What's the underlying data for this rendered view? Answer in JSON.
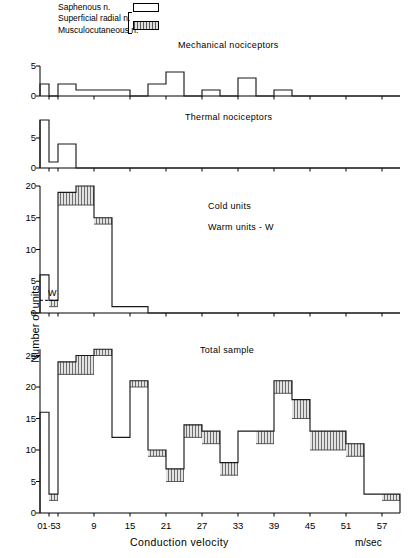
{
  "legend": {
    "items": [
      {
        "label": "Saphenous n.",
        "swatch": "open-box"
      },
      {
        "label": "Superficial  radial n.",
        "swatch": "hatched-box"
      },
      {
        "label": "Musculocutaneous n.",
        "swatch": "hatched-box"
      }
    ]
  },
  "axes": {
    "y_title": "Number of units",
    "x_title": "Conduction  velocity",
    "x_units": "m/sec",
    "x_ticklabels": [
      "0",
      "1·5",
      "3",
      "9",
      "15",
      "21",
      "27",
      "33",
      "39",
      "45",
      "51",
      "57"
    ],
    "x_tickvalues": [
      0,
      1.5,
      3,
      9,
      15,
      21,
      27,
      33,
      39,
      45,
      51,
      57
    ],
    "x_range": [
      0,
      60
    ]
  },
  "annotations": {
    "warm_marker": "W"
  },
  "chart_data": [
    {
      "type": "bar",
      "title": "Mechanical  nociceptors",
      "xlabel": "Conduction  velocity",
      "ylabel": "Number of units",
      "ylim": [
        0,
        5
      ],
      "yticks": [
        0,
        5
      ],
      "yticklabels": [
        "0",
        "5"
      ],
      "grid": false,
      "bin_edges": [
        0,
        1.5,
        3,
        6,
        9,
        12,
        15,
        18,
        21,
        24,
        27,
        30,
        33,
        36,
        39,
        42,
        45,
        48,
        51,
        54,
        57,
        60
      ],
      "series": [
        {
          "name": "Saphenous n.",
          "values": [
            2,
            0,
            2,
            1,
            1,
            1,
            0,
            2,
            4,
            0,
            1,
            0,
            3,
            0,
            1,
            0,
            0,
            0,
            0,
            0,
            0
          ]
        },
        {
          "name": "Superficial radial / Musculocutaneous n.",
          "values": [
            0,
            0,
            0,
            0,
            0,
            0,
            0,
            0,
            0,
            0,
            0,
            0,
            0,
            0,
            0,
            0,
            0,
            0,
            0,
            0,
            0
          ]
        }
      ]
    },
    {
      "type": "bar",
      "title": "Thermal  nociceptors",
      "xlabel": "Conduction  velocity",
      "ylabel": "Number of units",
      "ylim": [
        0,
        8
      ],
      "yticks": [
        0,
        5
      ],
      "yticklabels": [
        "0",
        "5"
      ],
      "grid": false,
      "bin_edges": [
        0,
        1.5,
        3,
        6,
        9,
        12,
        15,
        18,
        21,
        24,
        27,
        30,
        33,
        36,
        39,
        42,
        45,
        48,
        51,
        54,
        57,
        60
      ],
      "series": [
        {
          "name": "Saphenous n.",
          "values": [
            8,
            1,
            4,
            0,
            0,
            0,
            0,
            0,
            0,
            0,
            0,
            0,
            0,
            0,
            0,
            0,
            0,
            0,
            0,
            0,
            0
          ]
        },
        {
          "name": "Superficial radial / Musculocutaneous n.",
          "values": [
            0,
            0,
            0,
            0,
            0,
            0,
            0,
            0,
            0,
            0,
            0,
            0,
            0,
            0,
            0,
            0,
            0,
            0,
            0,
            0,
            0
          ]
        }
      ]
    },
    {
      "type": "bar",
      "title": "Cold units",
      "subtitle": "Warm units - W",
      "xlabel": "Conduction  velocity",
      "ylabel": "Number of units",
      "ylim": [
        0,
        20
      ],
      "yticks": [
        0,
        5,
        10,
        15,
        20
      ],
      "yticklabels": [
        "0",
        "5",
        "10",
        "15",
        "20"
      ],
      "grid": false,
      "bin_edges": [
        0,
        1.5,
        3,
        6,
        9,
        12,
        15,
        18,
        21,
        24,
        27,
        30,
        33,
        36,
        39,
        42,
        45,
        48,
        51,
        54,
        57,
        60
      ],
      "series": [
        {
          "name": "Saphenous n.",
          "values": [
            6,
            1,
            17,
            17,
            14,
            1,
            1,
            0,
            0,
            0,
            0,
            0,
            0,
            0,
            0,
            0,
            0,
            0,
            0,
            0,
            0
          ]
        },
        {
          "name": "Superficial radial / Musculocutaneous n.",
          "values": [
            0,
            1,
            2,
            3,
            1,
            0,
            0,
            0,
            0,
            0,
            0,
            0,
            0,
            0,
            0,
            0,
            0,
            0,
            0,
            0,
            0
          ]
        }
      ],
      "warm_units_level": 2
    },
    {
      "type": "bar",
      "title": "Total  sample",
      "xlabel": "Conduction  velocity",
      "ylabel": "Number of units",
      "ylim": [
        0,
        26
      ],
      "yticks": [
        0,
        5,
        10,
        15,
        20,
        25
      ],
      "yticklabels": [
        "0",
        "5",
        "10",
        "15",
        "20",
        "25"
      ],
      "grid": false,
      "bin_edges": [
        0,
        1.5,
        3,
        6,
        9,
        12,
        15,
        18,
        21,
        24,
        27,
        30,
        33,
        36,
        39,
        42,
        45,
        48,
        51,
        54,
        57,
        60
      ],
      "series": [
        {
          "name": "Saphenous n.",
          "values": [
            16,
            2,
            22,
            22,
            25,
            12,
            20,
            9,
            5,
            12,
            11,
            6,
            13,
            11,
            19,
            15,
            10,
            10,
            9,
            3,
            2
          ]
        },
        {
          "name": "Superficial radial / Musculocutaneous n.",
          "values": [
            0,
            1,
            2,
            3,
            1,
            0,
            1,
            1,
            2,
            2,
            2,
            2,
            0,
            2,
            2,
            3,
            3,
            3,
            2,
            0,
            1
          ]
        }
      ],
      "totals": [
        16,
        3,
        24,
        25,
        26,
        12,
        21,
        10,
        7,
        14,
        13,
        8,
        13,
        13,
        21,
        18,
        13,
        13,
        11,
        3,
        3
      ]
    }
  ]
}
